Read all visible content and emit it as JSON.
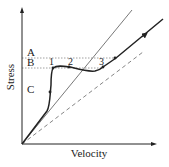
{
  "diagram": {
    "type": "stress-velocity diagram",
    "axes": {
      "x_label": "Velocity",
      "y_label": "Stress"
    },
    "region_labels": [
      {
        "id": "A",
        "label": "A"
      },
      {
        "id": "B",
        "label": "B"
      },
      {
        "id": "C",
        "label": "C"
      }
    ],
    "point_labels": [
      {
        "id": "1",
        "label": "1"
      },
      {
        "id": "2",
        "label": "2"
      },
      {
        "id": "3",
        "label": "3"
      }
    ],
    "lines": [
      {
        "name": "upper-reference-line",
        "style": "thin solid"
      },
      {
        "name": "lower-reference-line",
        "style": "dashed"
      },
      {
        "name": "flow-curve",
        "style": "thick solid with direction markers"
      },
      {
        "name": "threshold-upper",
        "style": "dotted horizontal"
      },
      {
        "name": "threshold-lower",
        "style": "dotted horizontal"
      }
    ],
    "colors": {
      "ink": "#222222",
      "reference": "#555555",
      "dotted": "#888888",
      "background": "#ffffff"
    }
  }
}
